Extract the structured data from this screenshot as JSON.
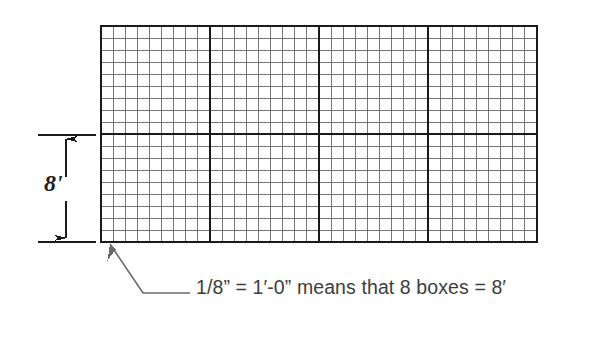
{
  "figure": {
    "background_color": "#ffffff",
    "grid": {
      "label": "graph-paper-grid",
      "x": 101,
      "y": 26,
      "width": 436,
      "height": 216,
      "columns": 36,
      "rows": 18,
      "cell_width": 12.111,
      "cell_height": 12.0,
      "minor_line_color": "#555555",
      "minor_line_width": 0.8,
      "major_line_color": "#1a1a1a",
      "major_line_width": 1.9,
      "major_every_columns": 9,
      "major_every_rows": 9,
      "border_color": "#1a1a1a",
      "border_width": 2.0
    },
    "dimension": {
      "label_text": "8'",
      "label_meaning": "eight feet",
      "extension_line_color": "#1a1a1a",
      "arrow_color": "#1a1a1a",
      "top_y": 135,
      "bottom_y": 242,
      "arrow_x": 66,
      "extension_x_start": 38,
      "extension_x_end": 96
    },
    "leader": {
      "arrow_tip_x": 110,
      "arrow_tip_y": 244,
      "elbow_x": 143,
      "elbow_y": 293,
      "end_x": 190,
      "end_y": 293,
      "color": "#5a5a5a"
    },
    "caption": {
      "text": "1/8” = 1′-0” means that 8 boxes = 8′",
      "color": "#3d3d3d"
    }
  }
}
